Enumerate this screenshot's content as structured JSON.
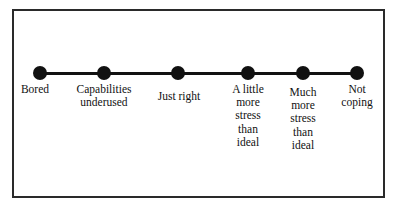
{
  "diagram": {
    "type": "continuum",
    "points": [
      {
        "label_lines": [
          "Bored"
        ],
        "x": 40,
        "label_x": 35,
        "label_top": 83
      },
      {
        "label_lines": [
          "Capabilities",
          "underused"
        ],
        "x": 104,
        "label_x": 104,
        "label_top": 83
      },
      {
        "label_lines": [
          "Just right"
        ],
        "x": 178,
        "label_x": 179,
        "label_top": 90
      },
      {
        "label_lines": [
          "A little",
          "more",
          "stress",
          "than",
          "ideal"
        ],
        "x": 248,
        "label_x": 248,
        "label_top": 83
      },
      {
        "label_lines": [
          "Much",
          "more",
          "stress",
          "than",
          "ideal"
        ],
        "x": 303,
        "label_x": 303,
        "label_top": 86
      },
      {
        "label_lines": [
          "Not",
          "coping"
        ],
        "x": 357,
        "label_x": 357,
        "label_top": 83
      }
    ]
  }
}
